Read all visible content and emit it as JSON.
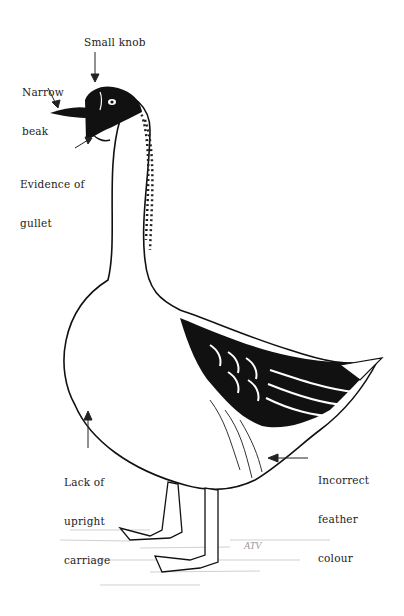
{
  "figure": {
    "colors": {
      "ink": "#111111",
      "paper": "#ffffff",
      "text": "#222222"
    },
    "signature": "ATV"
  },
  "labels": [
    {
      "id": "small-knob",
      "text": "Small knob"
    },
    {
      "id": "narrow-beak",
      "line1": "Narrow",
      "line2": "beak"
    },
    {
      "id": "evidence-of-gullet",
      "line1": "Evidence of",
      "line2": "gullet"
    },
    {
      "id": "lack-of-upright-carriage",
      "line1": "Lack of",
      "line2": "upright",
      "line3": "carriage"
    },
    {
      "id": "incorrect-feather-colour",
      "line1": "Incorrect",
      "line2": "feather",
      "line3": "colour"
    }
  ]
}
